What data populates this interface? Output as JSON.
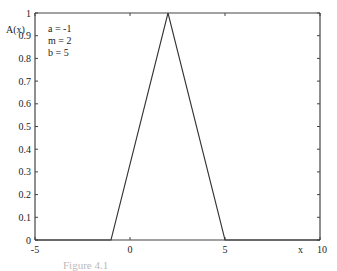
{
  "chart_data": {
    "type": "line",
    "title": "",
    "xlabel": "x",
    "ylabel": "A(x)",
    "xlim": [
      -5,
      10
    ],
    "ylim": [
      0,
      1
    ],
    "x_ticks": [
      -5,
      0,
      5,
      10
    ],
    "x_tick_labels": [
      "-5",
      "0",
      "5",
      "10"
    ],
    "y_ticks": [
      0,
      0.1,
      0.2,
      0.3,
      0.4,
      0.5,
      0.6,
      0.7,
      0.8,
      0.9,
      1
    ],
    "y_tick_labels": [
      "0",
      "0.1",
      "0.2",
      "0.3",
      "0.4",
      "0.5",
      "0.6",
      "0.7",
      "0.8",
      "0.9",
      "1"
    ],
    "grid": false,
    "series": [
      {
        "name": "A(x) triangular membership",
        "x": [
          -5,
          -1,
          2,
          5,
          10
        ],
        "y": [
          0,
          0,
          1,
          0,
          0
        ]
      }
    ],
    "annotations": [
      "a = -1",
      "m = 2",
      "b  = 5"
    ],
    "annotation_position": "top-left"
  },
  "caption": "Figure 4.1"
}
